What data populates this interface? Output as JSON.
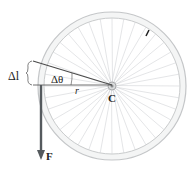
{
  "diagram": {
    "labels": {
      "arc_length": "Δl",
      "angle": "Δθ",
      "radius": "r",
      "center": "C",
      "force": "F"
    },
    "spoke_count": 36,
    "colors": {
      "rim": "#c9cbcc",
      "rim_fill": "#f4f5f5",
      "spokes": "#d2d4d6",
      "arrow": "#555a5e",
      "lines": "#4a4a4a",
      "text": "#222222"
    }
  }
}
